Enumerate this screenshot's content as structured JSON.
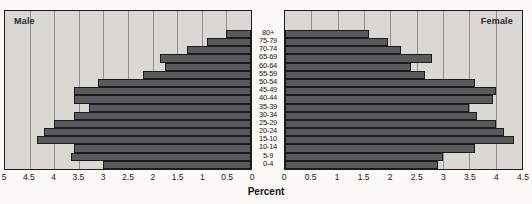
{
  "figure": {
    "left_panel_label": "Male",
    "right_panel_label": "Female",
    "xlabel": "Percent"
  },
  "chart_data": {
    "type": "bar",
    "subtype": "population-pyramid",
    "title": "",
    "xlabel": "Percent",
    "grid": true,
    "categories": [
      "80+",
      "75-79",
      "70-74",
      "65-69",
      "60-64",
      "55-59",
      "50-54",
      "45-49",
      "40-44",
      "35-39",
      "30-34",
      "25-29",
      "20-24",
      "15-10",
      "10-14",
      "5-9",
      "0-4"
    ],
    "series": [
      {
        "name": "Male",
        "side": "left",
        "axis_max": 5,
        "values": [
          0.5,
          0.9,
          1.3,
          1.85,
          1.75,
          2.2,
          3.1,
          3.6,
          3.6,
          3.3,
          3.6,
          4.0,
          4.2,
          4.35,
          3.6,
          3.65,
          3.0
        ]
      },
      {
        "name": "Female",
        "side": "right",
        "axis_max": 4.5,
        "values": [
          1.6,
          1.95,
          2.2,
          2.8,
          2.4,
          2.65,
          3.6,
          4.0,
          3.95,
          3.5,
          3.65,
          4.0,
          4.15,
          4.35,
          3.6,
          3.0,
          2.9
        ]
      }
    ],
    "left_axis_ticks": [
      "5",
      "4.5",
      "4",
      "3.5",
      "3",
      "2.5",
      "2",
      "1.5",
      "1",
      "0.5",
      "0"
    ],
    "right_axis_ticks": [
      "0",
      "0.5",
      "1",
      "1.5",
      "2",
      "2.5",
      "3",
      "3.5",
      "4",
      "4.5"
    ],
    "colors": {
      "bar": "#5a5a5c",
      "bar_border": "#1b1b1b",
      "panel_bg": "#dad8d2",
      "gridline": "#8f8f8f",
      "panel_border": "#1b1b1b",
      "text": "#1b1b1b"
    }
  }
}
